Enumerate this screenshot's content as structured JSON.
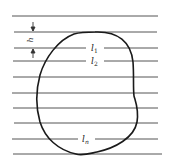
{
  "diagram": {
    "spacing_label": "h",
    "chord_labels": [
      {
        "main": "l",
        "sub": "1"
      },
      {
        "main": "l",
        "sub": "2"
      },
      {
        "main": "l",
        "sub": "n"
      }
    ],
    "line_color": "#555555",
    "curve_color": "#1a1a1a",
    "line_count": 10
  }
}
